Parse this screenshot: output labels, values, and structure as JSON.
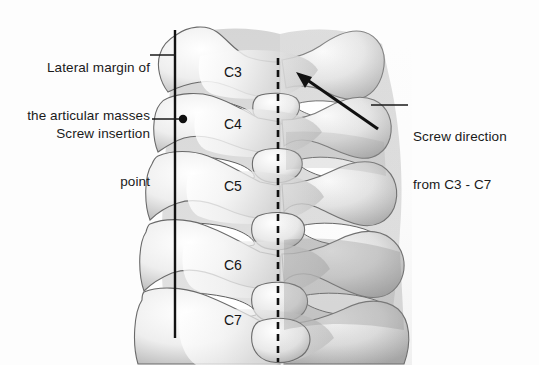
{
  "figure": {
    "background_color": "#fdfdfd",
    "ink_color": "#1a1a1a",
    "bone_fill": "#f2f2f2",
    "bone_outline": "#5a5a5a",
    "shadow_color": "#9a9a9a"
  },
  "annotations": {
    "lateral_margin": {
      "line1": "Lateral margin of",
      "line2": "the articular masses"
    },
    "screw_insertion": {
      "line1": "Screw insertion",
      "line2": "point"
    },
    "screw_direction": {
      "line1": "Screw direction",
      "line2": "from C3 - C7"
    }
  },
  "vertebrae": [
    {
      "label": "C3",
      "x": 224,
      "y": 65
    },
    {
      "label": "C4",
      "x": 224,
      "y": 117
    },
    {
      "label": "C5",
      "x": 224,
      "y": 179
    },
    {
      "label": "C6",
      "x": 224,
      "y": 258
    },
    {
      "label": "C7",
      "x": 224,
      "y": 313
    }
  ],
  "guides": {
    "lateral_margin_line": {
      "x": 175,
      "y1": 30,
      "y2": 338,
      "style": "solid"
    },
    "midline": {
      "x": 278,
      "y1": 58,
      "y2": 362,
      "style": "dashed"
    },
    "insertion_dot": {
      "x": 183,
      "y": 119,
      "r": 4.2
    },
    "screw_arrow": {
      "x1": 378,
      "y1": 129,
      "x2": 299,
      "y2": 74
    }
  }
}
